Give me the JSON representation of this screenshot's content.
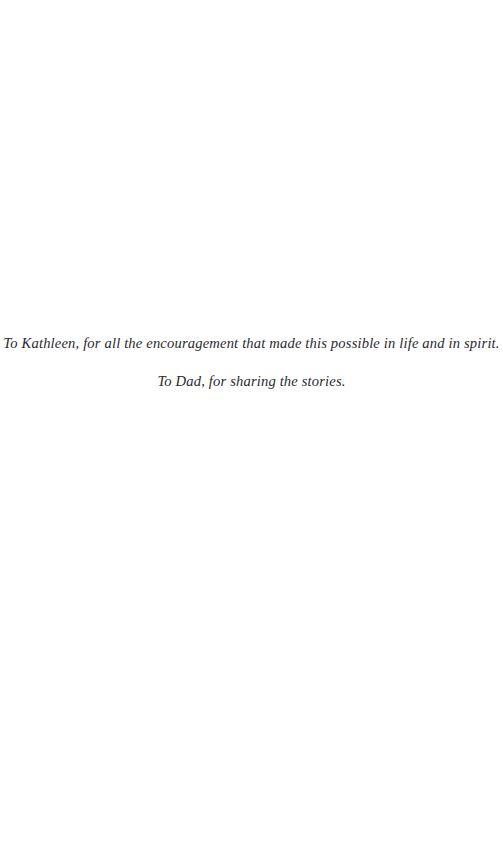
{
  "page": {
    "kind": "book-dedication-page",
    "background_color": "#ffffff",
    "text_color": "#2a2a30"
  },
  "dedication": {
    "lines": [
      "To Kathleen, for all the encouragement that made this possible in life and in spirit.",
      "To Dad, for sharing the stories."
    ]
  }
}
